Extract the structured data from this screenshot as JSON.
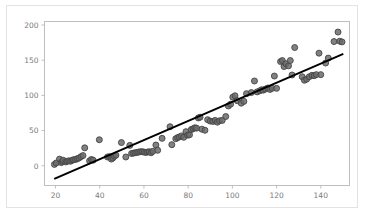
{
  "figure": {
    "background_color": "#ffffff",
    "frame_color": "#e3e3e3",
    "axes_color": "#bfbfbf",
    "tick_label_color": "#7a7a7a"
  },
  "chart_data": {
    "type": "scatter",
    "title": "",
    "xlabel": "",
    "ylabel": "",
    "xlim": [
      15,
      153
    ],
    "ylim": [
      -28,
      205
    ],
    "xticks": [
      20,
      40,
      60,
      80,
      100,
      120,
      140
    ],
    "xtick_labels": [
      "20",
      "40",
      "60",
      "80",
      "100",
      "120",
      "140"
    ],
    "yticks": [
      0,
      50,
      100,
      150,
      200
    ],
    "ytick_labels": [
      "0",
      "50",
      "100",
      "150",
      "200"
    ],
    "grid": false,
    "legend": null,
    "marker": {
      "shape": "circle",
      "face_color": "#6b6b6b",
      "edge_color": "#454545",
      "size_px": 6.0,
      "opacity": 0.85
    },
    "series": [
      {
        "name": "observations",
        "type": "scatter",
        "x": [
          19.5,
          20.3,
          21.8,
          22.6,
          23.1,
          23.4,
          24.6,
          25.2,
          26.0,
          26.8,
          27.5,
          28.2,
          29.0,
          29.8,
          30.6,
          31.5,
          32.4,
          33.2,
          35.4,
          36.2,
          37.0,
          39.8,
          43.5,
          44.4,
          45.2,
          45.9,
          46.6,
          47.3,
          49.8,
          51.8,
          53.6,
          54.4,
          55.2,
          56.0,
          56.8,
          57.6,
          58.4,
          59.2,
          60.0,
          60.8,
          61.6,
          62.4,
          63.2,
          64.0,
          65.4,
          66.2,
          68.2,
          71.8,
          72.6,
          74.4,
          75.2,
          76.0,
          77.0,
          78.0,
          79.0,
          79.8,
          80.6,
          81.4,
          82.2,
          83.0,
          83.8,
          84.6,
          85.4,
          86.2,
          87.6,
          88.8,
          90.0,
          91.2,
          92.2,
          93.2,
          94.2,
          95.4,
          97.0,
          98.2,
          99.2,
          100.2,
          101.2,
          102.2,
          104.0,
          105.2,
          106.4,
          108.6,
          110.0,
          111.2,
          112.4,
          113.2,
          114.0,
          115.0,
          116.0,
          117.0,
          118.0,
          119.0,
          120.0,
          121.8,
          122.6,
          123.4,
          124.2,
          125.4,
          126.2,
          127.0,
          128.2,
          131.6,
          132.6,
          133.6,
          134.8,
          136.0,
          137.0,
          138.0,
          139.2,
          140.0,
          142.2,
          143.4,
          146.0,
          147.8,
          148.6,
          149.6
        ],
        "y": [
          2.0,
          4.0,
          9.5,
          4.5,
          6.0,
          8.0,
          5.5,
          6.5,
          7.0,
          6.5,
          8.0,
          8.5,
          9.0,
          10.0,
          11.0,
          13.0,
          14.5,
          25.5,
          7.0,
          9.0,
          8.0,
          37.0,
          12.5,
          13.0,
          9.5,
          11.0,
          13.5,
          15.0,
          33.0,
          12.5,
          29.0,
          17.5,
          18.0,
          18.5,
          19.0,
          19.5,
          20.0,
          20.0,
          19.5,
          19.0,
          19.5,
          20.0,
          18.5,
          20.5,
          29.5,
          22.0,
          39.0,
          55.5,
          30.0,
          38.5,
          40.0,
          41.0,
          42.5,
          40.5,
          48.5,
          43.5,
          44.0,
          51.5,
          52.5,
          54.0,
          53.5,
          68.0,
          69.0,
          52.0,
          50.5,
          65.5,
          63.5,
          63.0,
          64.5,
          62.0,
          64.0,
          64.5,
          70.0,
          85.0,
          87.5,
          97.5,
          99.5,
          92.5,
          89.0,
          91.5,
          102.5,
          104.0,
          120.5,
          105.0,
          106.5,
          108.0,
          107.5,
          109.0,
          110.5,
          108.5,
          110.0,
          127.5,
          110.0,
          148.0,
          149.5,
          141.0,
          145.0,
          142.0,
          149.5,
          129.0,
          168.0,
          126.5,
          121.5,
          123.0,
          126.5,
          128.5,
          128.0,
          129.5,
          160.0,
          129.5,
          146.0,
          153.0,
          176.5,
          190.0,
          177.0,
          176.0
        ]
      },
      {
        "name": "regression-line",
        "type": "line",
        "color": "#000000",
        "width_px": 2.0,
        "x": [
          19.4,
          150.2
        ],
        "y": [
          -18.5,
          159.0
        ]
      }
    ]
  }
}
